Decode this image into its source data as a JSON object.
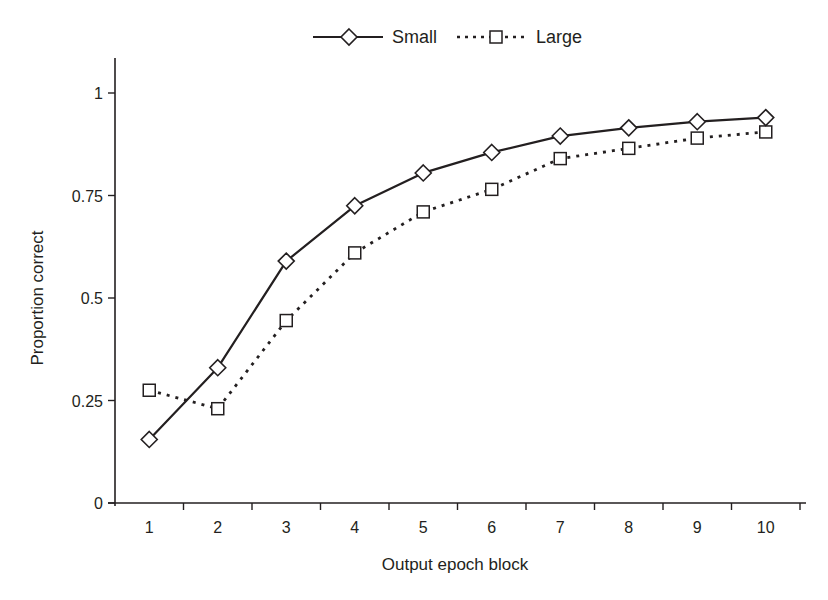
{
  "chart_data": {
    "type": "line",
    "title": "",
    "xlabel": "Output epoch block",
    "ylabel": "Proportion correct",
    "categories": [
      "1",
      "2",
      "3",
      "4",
      "5",
      "6",
      "7",
      "8",
      "9",
      "10"
    ],
    "x": [
      1,
      2,
      3,
      4,
      5,
      6,
      7,
      8,
      9,
      10
    ],
    "yticks": [
      0,
      0.25,
      0.5,
      0.75,
      1
    ],
    "ytick_labels": [
      "0",
      "0.25",
      "0.5",
      "0.75",
      "1"
    ],
    "ylim": [
      0,
      1.08
    ],
    "grid": false,
    "legend_position": "top-center",
    "series": [
      {
        "name": "Small",
        "line_style": "solid",
        "marker": "open-diamond",
        "values": [
          0.155,
          0.33,
          0.59,
          0.725,
          0.805,
          0.855,
          0.895,
          0.915,
          0.93,
          0.94
        ]
      },
      {
        "name": "Large",
        "line_style": "dotted",
        "marker": "open-square",
        "values": [
          0.275,
          0.23,
          0.445,
          0.61,
          0.71,
          0.765,
          0.84,
          0.865,
          0.89,
          0.905
        ]
      }
    ]
  },
  "legend": {
    "items": [
      {
        "label": "Small"
      },
      {
        "label": "Large"
      }
    ]
  },
  "axes": {
    "x_title": "Output epoch block",
    "y_title": "Proportion correct"
  },
  "colors": {
    "ink": "#231f20",
    "background": "#ffffff"
  }
}
